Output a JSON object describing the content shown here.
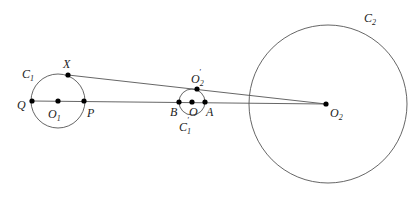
{
  "diagram": {
    "circles": [
      {
        "id": "C1",
        "label": "C",
        "sub": "1",
        "cx": 58,
        "cy": 101,
        "r": 27
      },
      {
        "id": "C1prime",
        "label": "C",
        "sub": "1",
        "prime": true,
        "cx": 192,
        "cy": 102,
        "r": 13
      },
      {
        "id": "C2",
        "label": "C",
        "sub": "2",
        "cx": 328,
        "cy": 104,
        "r": 79
      }
    ],
    "points": {
      "X": {
        "label": "X",
        "x": 68,
        "y": 75
      },
      "Q": {
        "label": "Q",
        "x": 32,
        "y": 101
      },
      "O1": {
        "label": "O",
        "sub": "1",
        "x": 58,
        "y": 101
      },
      "P": {
        "label": "P",
        "x": 84,
        "y": 101
      },
      "B": {
        "label": "B",
        "x": 179,
        "y": 102
      },
      "O": {
        "label": "O",
        "x": 192,
        "y": 102
      },
      "A": {
        "label": "A",
        "x": 205,
        "y": 102
      },
      "O2prime": {
        "label": "O",
        "sub": "2",
        "prime": true,
        "x": 197,
        "y": 89
      },
      "O2": {
        "label": "O",
        "sub": "2",
        "x": 326,
        "y": 104
      }
    },
    "segments": [
      [
        "Q",
        "O2"
      ],
      [
        "X",
        "O2"
      ]
    ],
    "labels": {
      "C1": "C",
      "C1_sub": "1",
      "C1p": "C",
      "C1p_sub": "1",
      "C1p_prime": "′",
      "C2": "C",
      "C2_sub": "2",
      "X": "X",
      "Q": "Q",
      "O1": "O",
      "O1_sub": "1",
      "P": "P",
      "B": "B",
      "O": "O",
      "A": "A",
      "O2p": "O",
      "O2p_sub": "2",
      "O2p_prime": "′",
      "O2": "O",
      "O2_sub": "2"
    },
    "colors": {
      "stroke": "#555555",
      "point": "#000000",
      "text": "#222222"
    }
  }
}
